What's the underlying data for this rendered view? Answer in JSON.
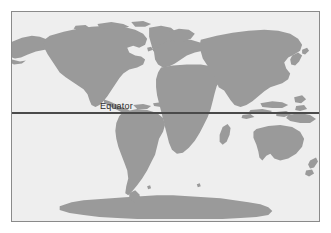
{
  "figure": {
    "kind": "world-map",
    "projection": "equirectangular",
    "width": 331,
    "height": 233,
    "background_color": "#ffffff"
  },
  "frame": {
    "border_color": "#8a8a8a",
    "border_width_px": 1,
    "x": 11,
    "y": 11,
    "width": 309,
    "height": 211
  },
  "colors": {
    "ocean": "#eeeeee",
    "land": "#9a9a9a",
    "land_edge": "#8f8f8f",
    "equator_line": "#4a4a4a",
    "label_text": "#2c2c2c",
    "frame_border": "#8a8a8a",
    "page_background": "#ffffff"
  },
  "annotations": {
    "equator": {
      "label": "Equator",
      "line_color": "#4a4a4a",
      "line_width_px": 2,
      "label_x": 88,
      "label_y": 89,
      "line_y_fraction": 0.485
    }
  },
  "landmasses": [
    {
      "name": "North America"
    },
    {
      "name": "Greenland"
    },
    {
      "name": "Canadian Arctic Archipelago"
    },
    {
      "name": "Alaska and Aleutian Islands"
    },
    {
      "name": "Central America and Caribbean"
    },
    {
      "name": "South America"
    },
    {
      "name": "Europe"
    },
    {
      "name": "Scandinavia and British Isles"
    },
    {
      "name": "Africa"
    },
    {
      "name": "Madagascar"
    },
    {
      "name": "Arabian Peninsula"
    },
    {
      "name": "Asia"
    },
    {
      "name": "Japan"
    },
    {
      "name": "Indonesia and Philippines"
    },
    {
      "name": "New Guinea"
    },
    {
      "name": "Australia"
    },
    {
      "name": "New Zealand"
    },
    {
      "name": "Antarctica"
    }
  ]
}
